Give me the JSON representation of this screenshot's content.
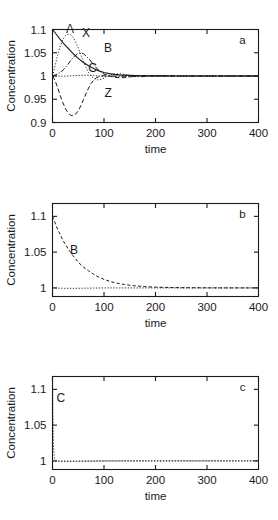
{
  "figure": {
    "panels": [
      {
        "letter": "a",
        "ylabel": "Concentration",
        "xlabel": "time",
        "xticks": [
          "0",
          "100",
          "200",
          "300",
          "400"
        ],
        "yticks": [
          "0.9",
          "0.95",
          "1",
          "1.05",
          "1.1"
        ],
        "curve_labels": [
          {
            "text": "A",
            "x": 34,
            "y": 1.092
          },
          {
            "text": "X",
            "x": 65,
            "y": 1.083
          },
          {
            "text": "B",
            "x": 108,
            "y": 1.052
          },
          {
            "text": "C",
            "x": 78,
            "y": 1.008
          },
          {
            "text": "Z",
            "x": 108,
            "y": 0.955
          }
        ]
      },
      {
        "letter": "b",
        "ylabel": "Concentration",
        "xlabel": "time",
        "xticks": [
          "0",
          "100",
          "200",
          "300",
          "400"
        ],
        "yticks": [
          "1",
          "1.05",
          "1.1"
        ],
        "curve_labels": [
          {
            "text": "B",
            "x": 42,
            "y": 1.047
          }
        ]
      },
      {
        "letter": "c",
        "ylabel": "Concentration",
        "xlabel": "time",
        "xticks": [
          "0",
          "100",
          "200",
          "300",
          "400"
        ],
        "yticks": [
          "1",
          "1.05",
          "1.1"
        ],
        "curve_labels": [
          {
            "text": "C",
            "x": 16,
            "y": 1.083
          }
        ]
      }
    ]
  },
  "chart_data": [
    {
      "type": "line",
      "panel": "a",
      "title": "",
      "xlabel": "time",
      "ylabel": "Concentration",
      "xlim": [
        0,
        400
      ],
      "ylim": [
        0.9,
        1.1
      ],
      "xticks": [
        0,
        100,
        200,
        300,
        400
      ],
      "yticks": [
        0.9,
        0.95,
        1.0,
        1.05,
        1.1
      ],
      "grid": false,
      "legend": "inline-labels",
      "annotations": [
        "a"
      ],
      "series": [
        {
          "name": "A",
          "style": "solid",
          "x": [
            0,
            10,
            20,
            30,
            40,
            50,
            60,
            70,
            80,
            90,
            100,
            110,
            120,
            130,
            140,
            150,
            160,
            180,
            200,
            240,
            280,
            320,
            360,
            400
          ],
          "y": [
            1.1,
            1.086,
            1.072,
            1.06,
            1.048,
            1.038,
            1.029,
            1.022,
            1.016,
            1.011,
            1.0075,
            1.005,
            1.0035,
            1.0025,
            1.0018,
            1.0013,
            1.001,
            1.0006,
            1.0003,
            1.0001,
            1.0,
            1.0,
            1.0,
            1.0
          ]
        },
        {
          "name": "X",
          "style": "dotted",
          "x": [
            0,
            5,
            10,
            15,
            20,
            25,
            30,
            35,
            40,
            45,
            50,
            55,
            60,
            65,
            70,
            75,
            80,
            85,
            90,
            95,
            100,
            110,
            120,
            130,
            140,
            150,
            160,
            170,
            180,
            200,
            220,
            250,
            300,
            350,
            400
          ],
          "y": [
            1.0,
            1.022,
            1.045,
            1.064,
            1.078,
            1.087,
            1.09,
            1.089,
            1.083,
            1.073,
            1.06,
            1.046,
            1.032,
            1.019,
            1.008,
            1.0,
            0.995,
            0.992,
            0.9915,
            0.993,
            0.9955,
            1.0015,
            1.0045,
            1.0048,
            1.0032,
            1.0012,
            0.9995,
            0.9988,
            0.9988,
            1.0005,
            1.0008,
            1.0,
            1.0,
            1.0,
            1.0
          ]
        },
        {
          "name": "B",
          "style": "dash-dot",
          "x": [
            0,
            10,
            20,
            30,
            40,
            50,
            55,
            60,
            70,
            80,
            90,
            100,
            110,
            120,
            130,
            140,
            150,
            160,
            170,
            180,
            200,
            220,
            250,
            300,
            350,
            400
          ],
          "y": [
            1.0,
            1.004,
            1.012,
            1.025,
            1.04,
            1.049,
            1.05,
            1.048,
            1.038,
            1.024,
            1.012,
            1.004,
            1.0005,
            0.9995,
            0.9993,
            0.9994,
            0.9993,
            0.9988,
            0.9986,
            0.999,
            1.0004,
            1.0006,
            1.0,
            1.0,
            1.0,
            1.0
          ]
        },
        {
          "name": "C",
          "style": "fine-dotted",
          "x": [
            0,
            10,
            20,
            30,
            40,
            50,
            60,
            70,
            80,
            90,
            100,
            110,
            120,
            130,
            140,
            150,
            170,
            200,
            250,
            300,
            350,
            400
          ],
          "y": [
            1.0,
            0.9998,
            0.9998,
            1.0,
            1.0006,
            1.0012,
            1.0016,
            1.0015,
            1.0008,
            1.0,
            0.9996,
            0.9996,
            1.0,
            1.0004,
            1.0005,
            1.0003,
            1.0,
            1.0,
            1.0,
            1.0,
            1.0,
            1.0
          ]
        },
        {
          "name": "Z",
          "style": "long-dash",
          "x": [
            0,
            5,
            10,
            15,
            20,
            25,
            30,
            35,
            40,
            45,
            50,
            55,
            60,
            65,
            70,
            75,
            80,
            85,
            90,
            95,
            100,
            110,
            120,
            130,
            140,
            150,
            160,
            170,
            180,
            200,
            220,
            250,
            300,
            350,
            400
          ],
          "y": [
            1.0,
            0.99,
            0.975,
            0.958,
            0.943,
            0.93,
            0.921,
            0.9155,
            0.9148,
            0.918,
            0.925,
            0.936,
            0.949,
            0.962,
            0.974,
            0.984,
            0.991,
            0.996,
            0.9985,
            1.0,
            1.0005,
            0.9998,
            0.9975,
            0.9962,
            0.9965,
            0.998,
            0.9995,
            1.0008,
            1.0012,
            1.0,
            0.9996,
            1.0,
            1.0,
            1.0,
            1.0
          ]
        }
      ]
    },
    {
      "type": "line",
      "panel": "b",
      "title": "",
      "xlabel": "time",
      "ylabel": "Concentration",
      "xlim": [
        0,
        400
      ],
      "ylim": [
        0.988,
        1.118
      ],
      "xticks": [
        0,
        100,
        200,
        300,
        400
      ],
      "yticks": [
        1.0,
        1.05,
        1.1
      ],
      "grid": false,
      "legend": "inline-labels",
      "annotations": [
        "b"
      ],
      "series": [
        {
          "name": "B",
          "style": "dashed",
          "x": [
            0,
            10,
            20,
            30,
            40,
            50,
            60,
            70,
            80,
            90,
            100,
            110,
            120,
            130,
            140,
            150,
            160,
            170,
            180,
            200,
            220,
            250,
            300,
            350,
            400
          ],
          "y": [
            1.1,
            1.082,
            1.067,
            1.055,
            1.045,
            1.036,
            1.029,
            1.024,
            1.019,
            1.015,
            1.012,
            1.0095,
            1.0075,
            1.006,
            1.0047,
            1.0037,
            1.0029,
            1.0023,
            1.0018,
            1.0011,
            1.0007,
            1.0003,
            1.0001,
            1.0,
            1.0
          ]
        },
        {
          "name": "baseline",
          "style": "fine-dotted",
          "x": [
            0,
            20,
            40,
            60,
            80,
            100,
            150,
            200,
            250,
            300,
            350,
            400
          ],
          "y": [
            1.0,
            0.9995,
            0.9994,
            0.9996,
            0.9998,
            1.0,
            1.0,
            1.0,
            1.0,
            1.0,
            1.0,
            1.0
          ]
        }
      ]
    },
    {
      "type": "line",
      "panel": "c",
      "title": "",
      "xlabel": "time",
      "ylabel": "Concentration",
      "xlim": [
        0,
        400
      ],
      "ylim": [
        0.988,
        1.118
      ],
      "xticks": [
        0,
        100,
        200,
        300,
        400
      ],
      "yticks": [
        1.0,
        1.05,
        1.1
      ],
      "grid": false,
      "legend": "inline-labels",
      "annotations": [
        "c"
      ],
      "series": [
        {
          "name": "C",
          "style": "dotted",
          "x": [
            0,
            0.5,
            1,
            1.5,
            2,
            3,
            4,
            6,
            8,
            12,
            20,
            40,
            80,
            150,
            250,
            400
          ],
          "y": [
            1.118,
            1.09,
            1.06,
            1.035,
            1.02,
            1.008,
            1.003,
            1.0008,
            1.0,
            0.9995,
            0.9994,
            0.9996,
            0.9998,
            1.0,
            1.0,
            1.0
          ]
        },
        {
          "name": "baseline",
          "style": "fine-dotted",
          "x": [
            0,
            20,
            40,
            60,
            80,
            100,
            150,
            200,
            250,
            300,
            350,
            400
          ],
          "y": [
            1.0,
            0.9996,
            0.9995,
            0.9996,
            0.9998,
            1.0,
            1.0,
            1.0,
            1.0,
            1.0,
            1.0,
            1.0
          ]
        }
      ]
    }
  ]
}
